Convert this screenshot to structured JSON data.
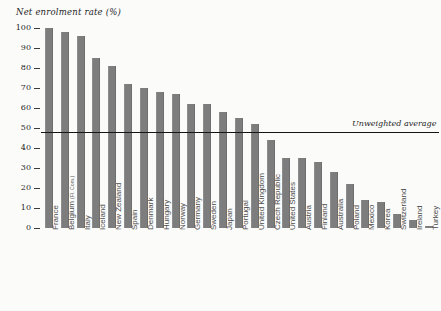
{
  "chart_data": {
    "type": "bar",
    "title": "Net enrolment rate (%)",
    "xlabel": "",
    "ylabel": "Net enrolment rate (%)",
    "ylim": [
      0,
      100
    ],
    "yticks": [
      0,
      10,
      20,
      30,
      40,
      50,
      60,
      70,
      80,
      90,
      100
    ],
    "grid": false,
    "legend": "none",
    "bar_color": "#7d7d7d",
    "categories": [
      "France",
      "Belgium (Fl. Com.)",
      "Italy",
      "Iceland",
      "New Zealand",
      "Spain",
      "Denmark",
      "Hungary",
      "Norway",
      "Germany",
      "Sweden",
      "Japan",
      "Portugal",
      "United Kingdom",
      "Czech Republic",
      "United States",
      "Austria",
      "Finland",
      "Australia",
      "Poland",
      "Mexico",
      "Korea",
      "Switzerland",
      "Ireland",
      "Turkey"
    ],
    "values": [
      100,
      98,
      96,
      85,
      81,
      72,
      70,
      68,
      67,
      62,
      62,
      58,
      55,
      52,
      44,
      35,
      35,
      33,
      28,
      22,
      14,
      13,
      7,
      4,
      1
    ],
    "annotations": [
      {
        "label": "Unweighted average",
        "type": "horizontal-line",
        "value": 48,
        "line_color": "#151515"
      }
    ]
  },
  "labels": {
    "belgium_main": "Belgium",
    "belgium_sub": "(Fl. Com.)"
  }
}
